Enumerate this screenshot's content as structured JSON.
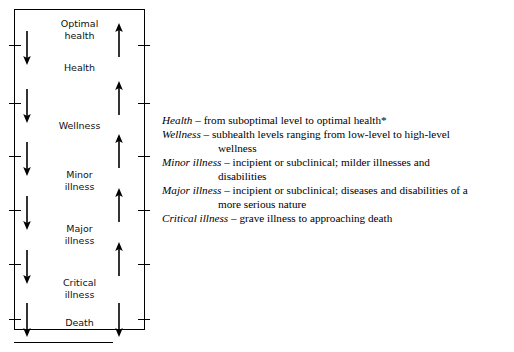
{
  "diagram": {
    "stages": [
      {
        "label": "Optimal\nhealth",
        "left_arrow": "none",
        "right_arrow": "none"
      },
      {
        "label": "Health",
        "left_arrow": "down",
        "right_arrow": "up"
      },
      {
        "label": "Wellness",
        "left_arrow": "down",
        "right_arrow": "up"
      },
      {
        "label": "Minor\nillness",
        "left_arrow": "down",
        "right_arrow": "up"
      },
      {
        "label": "Major\nillness",
        "left_arrow": "down",
        "right_arrow": "up"
      },
      {
        "label": "Critical\nillness",
        "left_arrow": "down",
        "right_arrow": "up"
      },
      {
        "label": "Death",
        "left_arrow": "down",
        "right_arrow": "down"
      }
    ],
    "arrow_icons": {
      "down": "arrow-down-icon",
      "up": "arrow-up-icon"
    }
  },
  "definitions": [
    {
      "term": "Health",
      "dash": " – ",
      "text": "from suboptimal level to optimal health*",
      "continuation": ""
    },
    {
      "term": "Wellness",
      "dash": " – ",
      "text": "subhealth levels ranging from low-level to high-level",
      "continuation": "wellness"
    },
    {
      "term": "Minor illness",
      "dash": " – ",
      "text": "incipient or subclinical; milder illnesses and",
      "continuation": "disabilities"
    },
    {
      "term": "Major illness",
      "dash": " – ",
      "text": "incipient or subclinical; diseases and disabilities of a",
      "continuation": "more serious nature"
    },
    {
      "term": "Critical illness",
      "dash": " – ",
      "text": "grave illness to approaching death",
      "continuation": ""
    }
  ],
  "colors": {
    "ink": "#000000",
    "background": "#ffffff"
  }
}
